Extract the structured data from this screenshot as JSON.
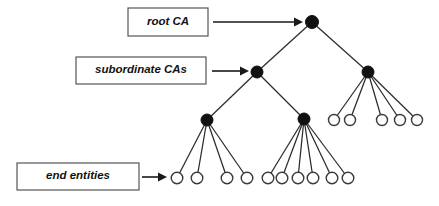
{
  "diagram": {
    "type": "tree-diagram",
    "canvas": {
      "width": 439,
      "height": 206,
      "background": "#ffffff"
    },
    "colors": {
      "ca_node_fill": "#111111",
      "end_entity_fill": "#ffffff",
      "stroke": "#2b2b2b",
      "box_border": "#555555",
      "text": "#111111"
    },
    "labels": [
      {
        "id": "root-ca",
        "text": "root CA",
        "box": {
          "x": 128,
          "y": 8,
          "w": 80,
          "h": 28
        },
        "text_x": 168,
        "text_y": 22,
        "font_size": 11.5,
        "arrow": {
          "x1": 213,
          "y1": 22,
          "x2": 303,
          "y2": 22
        }
      },
      {
        "id": "subordinate-cas",
        "text": "subordinate CAs",
        "box": {
          "x": 76,
          "y": 57,
          "w": 130,
          "h": 27
        },
        "text_x": 141,
        "text_y": 70,
        "font_size": 11.5,
        "arrow": {
          "x1": 212,
          "y1": 71,
          "x2": 249,
          "y2": 71
        }
      },
      {
        "id": "end-entities",
        "text": "end entities",
        "box": {
          "x": 17,
          "y": 163,
          "w": 122,
          "h": 27
        },
        "text_x": 78,
        "text_y": 176,
        "font_size": 11.5,
        "arrow": {
          "x1": 142,
          "y1": 177,
          "x2": 167,
          "y2": 177
        }
      }
    ],
    "nodes": {
      "certificate_authorities": [
        {
          "id": "root",
          "level": 0,
          "cx": 312,
          "cy": 22,
          "r": 6.5
        },
        {
          "id": "sub-left",
          "level": 1,
          "cx": 257,
          "cy": 72,
          "r": 6.0
        },
        {
          "id": "sub-right",
          "level": 1,
          "cx": 368,
          "cy": 72,
          "r": 6.0
        },
        {
          "id": "ca-left",
          "level": 2,
          "cx": 207,
          "cy": 120,
          "r": 6.0
        },
        {
          "id": "ca-mid",
          "level": 2,
          "cx": 304,
          "cy": 119,
          "r": 6.0
        }
      ],
      "end_entities": [
        {
          "id": "ee-r1",
          "parent": "sub-right",
          "cx": 334,
          "cy": 120,
          "r": 5.5
        },
        {
          "id": "ee-r2",
          "parent": "sub-right",
          "cx": 350,
          "cy": 120,
          "r": 5.5
        },
        {
          "id": "ee-r3",
          "parent": "sub-right",
          "cx": 382,
          "cy": 120,
          "r": 5.5
        },
        {
          "id": "ee-r4",
          "parent": "sub-right",
          "cx": 400,
          "cy": 120,
          "r": 5.5
        },
        {
          "id": "ee-r5",
          "parent": "sub-right",
          "cx": 417,
          "cy": 120,
          "r": 5.5
        },
        {
          "id": "ee-l1",
          "parent": "ca-left",
          "cx": 177,
          "cy": 178,
          "r": 5.8
        },
        {
          "id": "ee-l2",
          "parent": "ca-left",
          "cx": 197,
          "cy": 178,
          "r": 5.8
        },
        {
          "id": "ee-l3",
          "parent": "ca-left",
          "cx": 227,
          "cy": 178,
          "r": 5.8
        },
        {
          "id": "ee-l4",
          "parent": "ca-left",
          "cx": 247,
          "cy": 178,
          "r": 5.8
        },
        {
          "id": "ee-m1",
          "parent": "ca-mid",
          "cx": 268,
          "cy": 178,
          "r": 5.8
        },
        {
          "id": "ee-m2",
          "parent": "ca-mid",
          "cx": 282,
          "cy": 178,
          "r": 5.8
        },
        {
          "id": "ee-m3",
          "parent": "ca-mid",
          "cx": 298,
          "cy": 178,
          "r": 5.8
        },
        {
          "id": "ee-m4",
          "parent": "ca-mid",
          "cx": 313,
          "cy": 178,
          "r": 5.8
        },
        {
          "id": "ee-m5",
          "parent": "ca-mid",
          "cx": 332,
          "cy": 178,
          "r": 5.8
        },
        {
          "id": "ee-m6",
          "parent": "ca-mid",
          "cx": 348,
          "cy": 178,
          "r": 5.8
        }
      ]
    },
    "edges": [
      {
        "from": "root",
        "to": "sub-left",
        "x1": 312,
        "y1": 22,
        "x2": 257,
        "y2": 72
      },
      {
        "from": "root",
        "to": "sub-right",
        "x1": 312,
        "y1": 22,
        "x2": 368,
        "y2": 72
      },
      {
        "from": "sub-left",
        "to": "ca-left",
        "x1": 257,
        "y1": 72,
        "x2": 207,
        "y2": 120
      },
      {
        "from": "sub-left",
        "to": "ca-mid",
        "x1": 257,
        "y1": 72,
        "x2": 304,
        "y2": 119
      },
      {
        "from": "sub-right",
        "to": "ee-r1",
        "x1": 368,
        "y1": 72,
        "x2": 334,
        "y2": 120
      },
      {
        "from": "sub-right",
        "to": "ee-r2",
        "x1": 368,
        "y1": 72,
        "x2": 350,
        "y2": 120
      },
      {
        "from": "sub-right",
        "to": "ee-r3",
        "x1": 368,
        "y1": 72,
        "x2": 382,
        "y2": 120
      },
      {
        "from": "sub-right",
        "to": "ee-r4",
        "x1": 368,
        "y1": 72,
        "x2": 400,
        "y2": 120
      },
      {
        "from": "sub-right",
        "to": "ee-r5",
        "x1": 368,
        "y1": 72,
        "x2": 417,
        "y2": 120
      },
      {
        "from": "ca-left",
        "to": "ee-l1",
        "x1": 207,
        "y1": 120,
        "x2": 177,
        "y2": 178
      },
      {
        "from": "ca-left",
        "to": "ee-l2",
        "x1": 207,
        "y1": 120,
        "x2": 197,
        "y2": 178
      },
      {
        "from": "ca-left",
        "to": "ee-l3",
        "x1": 207,
        "y1": 120,
        "x2": 227,
        "y2": 178
      },
      {
        "from": "ca-left",
        "to": "ee-l4",
        "x1": 207,
        "y1": 120,
        "x2": 247,
        "y2": 178
      },
      {
        "from": "ca-mid",
        "to": "ee-m1",
        "x1": 304,
        "y1": 119,
        "x2": 268,
        "y2": 178
      },
      {
        "from": "ca-mid",
        "to": "ee-m2",
        "x1": 304,
        "y1": 119,
        "x2": 282,
        "y2": 178
      },
      {
        "from": "ca-mid",
        "to": "ee-m3",
        "x1": 304,
        "y1": 119,
        "x2": 298,
        "y2": 178
      },
      {
        "from": "ca-mid",
        "to": "ee-m4",
        "x1": 304,
        "y1": 119,
        "x2": 313,
        "y2": 178
      },
      {
        "from": "ca-mid",
        "to": "ee-m5",
        "x1": 304,
        "y1": 119,
        "x2": 332,
        "y2": 178
      },
      {
        "from": "ca-mid",
        "to": "ee-m6",
        "x1": 304,
        "y1": 119,
        "x2": 348,
        "y2": 178
      }
    ]
  }
}
